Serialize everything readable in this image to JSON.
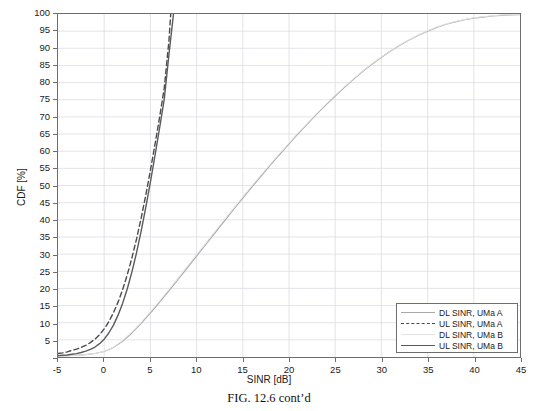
{
  "figure": {
    "caption": "FIG. 12.6 cont’d"
  },
  "chart_data": {
    "type": "line",
    "title": "",
    "xlabel": "SINR [dB]",
    "ylabel": "CDF [%]",
    "xlim": [
      -5,
      45
    ],
    "ylim": [
      0,
      100
    ],
    "xticks": [
      -5,
      0,
      5,
      10,
      15,
      20,
      25,
      30,
      35,
      40,
      45
    ],
    "xticklabels": [
      "-5",
      "0",
      "5",
      "10",
      "15",
      "20",
      "25",
      "30",
      "35",
      "40",
      "45"
    ],
    "yticks": [
      0,
      5,
      10,
      15,
      20,
      25,
      30,
      35,
      40,
      45,
      50,
      55,
      60,
      65,
      70,
      75,
      80,
      85,
      90,
      95,
      100
    ],
    "yticklabels": [
      "",
      "5",
      "10",
      "15",
      "20",
      "25",
      "30",
      "35",
      "40",
      "45",
      "50",
      "55",
      "60",
      "65",
      "70",
      "75",
      "80",
      "85",
      "90",
      "95",
      "100"
    ],
    "grid": true,
    "grid_color": "#d8d8e0",
    "legend_position": "lower right",
    "series": [
      {
        "name": "DL SINR, UMa A",
        "color": "#a9a9a9",
        "style": "solid",
        "width": 1.1,
        "x": [
          -5,
          -4,
          -3,
          -2,
          -1,
          0,
          1,
          2,
          3,
          4,
          5,
          6,
          7,
          8,
          9,
          10,
          11,
          12,
          13,
          14,
          15,
          16,
          17,
          18,
          19,
          20,
          21,
          22,
          23,
          24,
          25,
          26,
          27,
          28,
          29,
          30,
          31,
          32,
          33,
          34,
          35,
          36,
          37,
          38,
          39,
          40,
          41,
          42,
          43,
          44,
          45
        ],
        "y": [
          0.3,
          0.4,
          0.5,
          0.7,
          1.0,
          1.6,
          2.8,
          4.6,
          7.0,
          9.8,
          12.8,
          16.0,
          19.3,
          22.6,
          26.0,
          29.4,
          32.8,
          36.2,
          39.6,
          43.0,
          46.3,
          49.6,
          52.8,
          56.0,
          59.1,
          62.1,
          65.1,
          68.0,
          70.8,
          73.5,
          76.1,
          78.6,
          81.0,
          83.3,
          85.4,
          87.4,
          89.2,
          90.9,
          92.4,
          93.8,
          95.0,
          96.1,
          97.0,
          97.7,
          98.3,
          98.8,
          99.1,
          99.4,
          99.6,
          99.7,
          99.8
        ]
      },
      {
        "name": "UL SINR, UMa A",
        "color": "#4a4a4a",
        "style": "dashed",
        "width": 1.4,
        "x": [
          -5,
          -4.5,
          -4,
          -3.5,
          -3,
          -2.5,
          -2,
          -1.5,
          -1,
          -0.5,
          0,
          0.5,
          1,
          1.5,
          2,
          2.5,
          3,
          3.5,
          4,
          4.5,
          5,
          5.5,
          6,
          6.5,
          7,
          7.2
        ],
        "y": [
          1.0,
          1.2,
          1.5,
          1.9,
          2.3,
          2.8,
          3.4,
          4.2,
          5.2,
          6.5,
          8.2,
          10.3,
          12.9,
          16.0,
          19.7,
          24.0,
          28.9,
          34.4,
          40.5,
          47.2,
          54.4,
          62.0,
          70.0,
          78.4,
          92.0,
          100.0
        ]
      },
      {
        "name": "DL SINR, UMa B",
        "color": "#e2e2e2",
        "style": "solid",
        "width": 1.0,
        "x": [
          -5,
          -4,
          -3,
          -2,
          -1,
          0,
          1,
          2,
          3,
          4,
          5,
          6,
          7,
          8,
          9,
          10,
          11,
          12,
          13,
          14,
          15,
          16,
          17,
          18,
          19,
          20,
          21,
          22,
          23,
          24,
          25,
          26,
          27,
          28,
          29,
          30,
          31,
          32,
          33,
          34,
          35,
          36,
          37,
          38,
          39,
          40,
          41,
          42,
          43,
          44,
          45
        ],
        "y": [
          0.3,
          0.4,
          0.5,
          0.7,
          1.0,
          1.6,
          2.9,
          4.8,
          7.3,
          10.1,
          13.2,
          16.4,
          19.7,
          23.1,
          26.5,
          29.9,
          33.3,
          36.7,
          40.1,
          43.4,
          46.7,
          50.0,
          53.2,
          56.3,
          59.4,
          62.4,
          65.4,
          68.2,
          71.0,
          73.7,
          76.3,
          78.8,
          81.2,
          83.4,
          85.6,
          87.5,
          89.3,
          91.0,
          92.5,
          93.9,
          95.1,
          96.2,
          97.1,
          97.8,
          98.4,
          98.9,
          99.2,
          99.5,
          99.7,
          99.8,
          99.9
        ]
      },
      {
        "name": "UL SINR, UMa B",
        "color": "#5a5a5a",
        "style": "solid",
        "width": 1.4,
        "x": [
          -5,
          -4.5,
          -4,
          -3.5,
          -3,
          -2.5,
          -2,
          -1.5,
          -1,
          -0.5,
          0,
          0.5,
          1,
          1.5,
          2,
          2.5,
          3,
          3.5,
          4,
          4.5,
          5,
          5.5,
          6,
          6.5,
          7,
          7.5
        ],
        "y": [
          0.4,
          0.5,
          0.6,
          0.8,
          1.0,
          1.3,
          1.7,
          2.2,
          2.9,
          3.9,
          5.2,
          7.0,
          9.3,
          12.2,
          15.7,
          19.9,
          24.8,
          30.4,
          36.7,
          43.6,
          51.0,
          58.8,
          66.9,
          75.2,
          88.0,
          100.0
        ]
      }
    ]
  }
}
